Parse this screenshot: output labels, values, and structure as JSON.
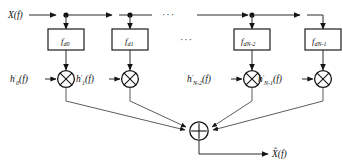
{
  "figure": {
    "input_label": "X(f)",
    "output_label": "X̂(f)",
    "ellipsis": "···",
    "sum_symbol": "+",
    "multiply_symbol": "×",
    "colors": {
      "line": "#2b2b2b",
      "box_stroke": "#1d1d1d",
      "text": "#111111",
      "background": "#ffffff"
    },
    "branches": [
      {
        "index": 0,
        "delay_block": "f",
        "delay_sub": "d0",
        "gain_label": "h",
        "gain_prime": "′",
        "gain_sub": "0",
        "gain_arg": "(f)"
      },
      {
        "index": 1,
        "delay_block": "f",
        "delay_sub": "d1",
        "gain_label": "h",
        "gain_prime": "′",
        "gain_sub": "1",
        "gain_arg": "(f)"
      },
      {
        "index": 2,
        "delay_block": "f",
        "delay_sub": "dN-2",
        "gain_label": "h",
        "gain_prime": "′",
        "gain_sub": "N-2",
        "gain_arg": "(f)"
      },
      {
        "index": 3,
        "delay_block": "f",
        "delay_sub": "dN-1",
        "gain_label": "h",
        "gain_prime": "′",
        "gain_sub": "N-1",
        "gain_arg": "(f)"
      }
    ]
  }
}
